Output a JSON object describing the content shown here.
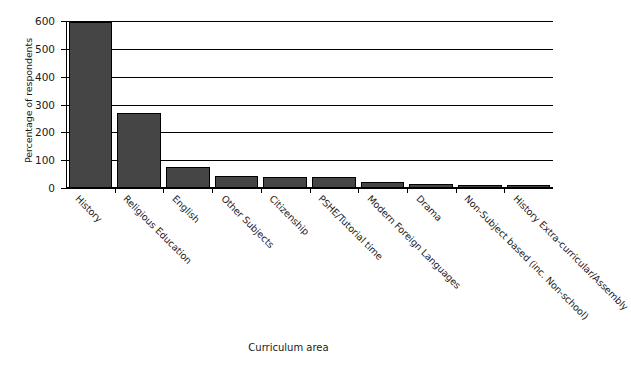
{
  "chart_data": {
    "type": "bar",
    "title": "",
    "xlabel": "Curriculum area",
    "ylabel": "Percentage of respondents",
    "ylim": [
      0,
      600
    ],
    "yticks": [
      0,
      100,
      200,
      300,
      400,
      500,
      600
    ],
    "grid": true,
    "legend": "none",
    "bar_color": "#454545",
    "bar_edge_color": "#000000",
    "categories": [
      "History",
      "Religious Education",
      "English",
      "Other Subjects",
      "Citizenship",
      "PSHE/Tutorial time",
      "Modern Foreign Languages",
      "Drama",
      "Non-Subject based (inc. Non-school)",
      "History Extra-curricular/Assembly"
    ],
    "values": [
      598,
      270,
      75,
      42,
      40,
      38,
      20,
      15,
      12,
      10
    ]
  },
  "axis": {
    "y_title": "Percentage of respondents",
    "x_title": "Curriculum area",
    "tick_labels": [
      "600",
      "500",
      "400",
      "300",
      "200",
      "100",
      "0"
    ]
  }
}
